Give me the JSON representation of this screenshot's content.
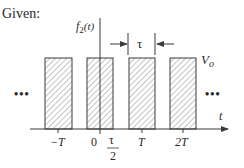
{
  "header": {
    "given_label": "Given:"
  },
  "function_label": {
    "base": "f",
    "subscript": "2",
    "arg": "(t)"
  },
  "pulse_width_label": "τ",
  "amplitude_label": {
    "base": "V",
    "subscript": "o"
  },
  "axis": {
    "t_label": "t"
  },
  "ellipsis": {
    "left": "•••",
    "right": "•••"
  },
  "ticks": [
    {
      "label": "−T"
    },
    {
      "label": "0"
    },
    {
      "label_num": "τ",
      "label_den": "2"
    },
    {
      "label": "T"
    },
    {
      "label": "2T"
    }
  ],
  "colors": {
    "stroke": "#3a3a3a",
    "hatch": "#8a8a8a",
    "text": "#2a2a2a"
  }
}
